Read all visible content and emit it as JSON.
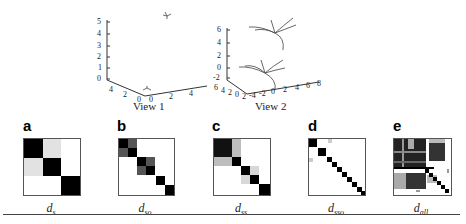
{
  "figure": {
    "views": [
      {
        "label": "View 1",
        "z_ticks": [
          "5",
          "4",
          "3",
          "2",
          "1",
          "0"
        ],
        "y_ticks": [
          "4",
          "2",
          "0"
        ],
        "x_ticks": [
          "0",
          "2",
          "4"
        ]
      },
      {
        "label": "View 2",
        "z_ticks": [
          "6",
          "4",
          "2",
          "0",
          "-2"
        ],
        "y_ticks": [
          "6",
          "4",
          "2",
          "0",
          "2"
        ],
        "x_ticks": [
          "-4",
          "-2",
          "0",
          "2",
          "4",
          "6",
          "8"
        ]
      }
    ],
    "panels": [
      {
        "letter": "a",
        "label_main": "d",
        "label_sub": "s"
      },
      {
        "letter": "b",
        "label_main": "d",
        "label_sub": "so"
      },
      {
        "letter": "c",
        "label_main": "d",
        "label_sub": "ss"
      },
      {
        "letter": "d",
        "label_main": "d",
        "label_sub": "sso"
      },
      {
        "letter": "e",
        "label_main": "d",
        "label_sub": "all"
      }
    ]
  },
  "colors": {
    "black": "#000000",
    "dark_gray": "#555555",
    "mid_gray": "#888888",
    "light_gray": "#d6d6d6",
    "axis": "#333333"
  }
}
